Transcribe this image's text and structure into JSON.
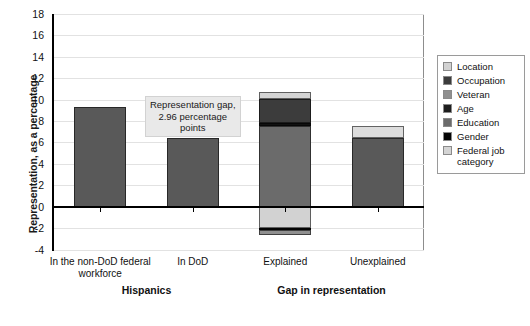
{
  "chart_data": {
    "type": "bar",
    "title": "",
    "subtitle": "",
    "xlabel": "",
    "ylabel": "Representation, as a percentage",
    "ylim": [
      -4,
      18
    ],
    "ytick_step": 2,
    "yticks": [
      "18",
      "16",
      "14",
      "12",
      "10",
      "8",
      "6",
      "4",
      "2",
      "0",
      "-2",
      "-4"
    ],
    "grid": "horizontal",
    "legend_position": "right",
    "categories": [
      "In the non-DoD federal workforce",
      "In DoD",
      "Explained",
      "Unexplained"
    ],
    "group_labels": [
      {
        "label": "Hispanics",
        "spans": [
          0,
          1
        ]
      },
      {
        "label": "Gap in representation",
        "spans": [
          2,
          3
        ]
      }
    ],
    "annotations": [
      {
        "text": "Representation gap, 2.96 percentage points",
        "value": 2.96,
        "attached_to": "In DoD"
      }
    ],
    "bars": [
      {
        "category": "In the non-DoD federal workforce",
        "total": 9.35,
        "segments": [
          {
            "name": "representation",
            "from": 0,
            "to": 9.35,
            "color": "#595959"
          }
        ]
      },
      {
        "category": "In DoD",
        "total": 6.39,
        "segments": [
          {
            "name": "representation",
            "from": 0,
            "to": 6.39,
            "color": "#595959"
          }
        ]
      },
      {
        "category": "Explained",
        "total": 10.75,
        "segments": [
          {
            "name": "Veteran",
            "from": -2.6,
            "to": -2.15,
            "color": "#8f8f8f"
          },
          {
            "name": "Gender",
            "from": -2.15,
            "to": -1.95,
            "color": "#050505"
          },
          {
            "name": "Location",
            "from": -1.95,
            "to": 0,
            "color": "#d2d2d2"
          },
          {
            "name": "Education",
            "from": 0,
            "to": 7.55,
            "color": "#6b6b6b"
          },
          {
            "name": "Age",
            "from": 7.55,
            "to": 7.8,
            "color": "#111111"
          },
          {
            "name": "Occupation",
            "from": 7.8,
            "to": 10.05,
            "color": "#3c3c3c"
          },
          {
            "name": "Federal job category",
            "from": 10.05,
            "to": 10.75,
            "color": "#d4d4d4"
          }
        ]
      },
      {
        "category": "Unexplained",
        "total": 7.5,
        "segments": [
          {
            "name": "unexplained-lower",
            "from": 0,
            "to": 6.42,
            "color": "#595959"
          },
          {
            "name": "unexplained-upper",
            "from": 6.42,
            "to": 7.5,
            "color": "#dcdcdc"
          }
        ]
      }
    ],
    "legend": [
      {
        "label": "Location",
        "color": "#d2d2d2"
      },
      {
        "label": "Occupation",
        "color": "#3c3c3c"
      },
      {
        "label": "Veteran",
        "color": "#8f8f8f"
      },
      {
        "label": "Age",
        "color": "#1d1d1d"
      },
      {
        "label": "Education",
        "color": "#6b6b6b"
      },
      {
        "label": "Gender",
        "color": "#050505"
      },
      {
        "label": "Federal job category",
        "color": "#d4d4d4"
      }
    ]
  }
}
